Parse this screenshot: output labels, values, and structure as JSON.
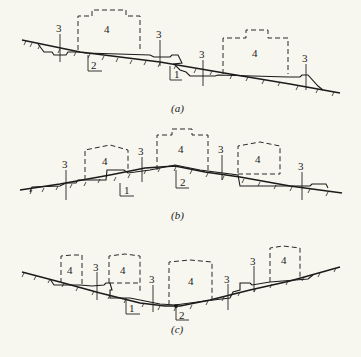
{
  "figure": {
    "panels": [
      {
        "id": "a",
        "caption": "(a)",
        "terrain": "slope",
        "labels": {
          "cut_fill_boundary": "1",
          "fill_section": "2",
          "drainage_marker": "3",
          "building_zone": "4"
        }
      },
      {
        "id": "b",
        "caption": "(b)",
        "terrain": "ridge",
        "labels": {
          "cut_fill_boundary": "1",
          "fill_section": "2",
          "drainage_marker": "3",
          "building_zone": "4"
        }
      },
      {
        "id": "c",
        "caption": "(c)",
        "terrain": "valley",
        "labels": {
          "cut_fill_boundary": "1",
          "fill_section": "2",
          "drainage_marker": "3",
          "building_zone": "4"
        }
      }
    ],
    "numbers": {
      "n1": "1",
      "n2": "2",
      "n3": "3",
      "n4": "4"
    }
  }
}
